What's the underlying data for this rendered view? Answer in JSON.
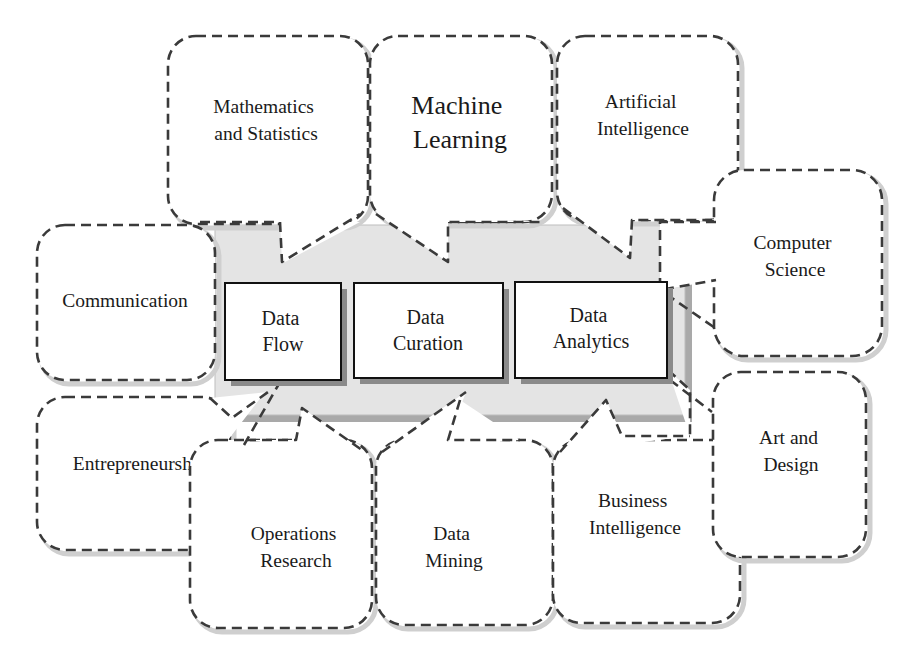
{
  "diagram": {
    "core_components": [
      {
        "id": "data-flow",
        "lines": [
          "Data",
          "Flow"
        ]
      },
      {
        "id": "data-curation",
        "lines": [
          "Data",
          "Curation"
        ]
      },
      {
        "id": "data-analytics",
        "lines": [
          "Data",
          "Analytics"
        ]
      }
    ],
    "disciplines": [
      {
        "id": "mathematics-and-statistics",
        "lines": [
          "Mathematics",
          "and Statistics"
        ]
      },
      {
        "id": "machine-learning",
        "lines": [
          "Machine",
          "Learning"
        ]
      },
      {
        "id": "artificial-intelligence",
        "lines": [
          "Artificial",
          "Intelligence"
        ]
      },
      {
        "id": "computer-science",
        "lines": [
          "Computer",
          "Science"
        ]
      },
      {
        "id": "communication",
        "lines": [
          "Communication"
        ]
      },
      {
        "id": "entrepreneurship",
        "lines": [
          "Entrepreneurship"
        ]
      },
      {
        "id": "operations-research",
        "lines": [
          "Operations",
          "Research"
        ]
      },
      {
        "id": "data-mining",
        "lines": [
          "Data",
          "Mining"
        ]
      },
      {
        "id": "business-intelligence",
        "lines": [
          "Business",
          "Intelligence"
        ]
      },
      {
        "id": "art-and-design",
        "lines": [
          "Art and",
          "Design"
        ]
      }
    ],
    "colors": {
      "panel": "#e4e4e4",
      "panel_shadow": "#a9a9a9",
      "dash_stroke": "#3a3a3a",
      "box_border": "#111111",
      "text": "#1a1a1a"
    }
  }
}
